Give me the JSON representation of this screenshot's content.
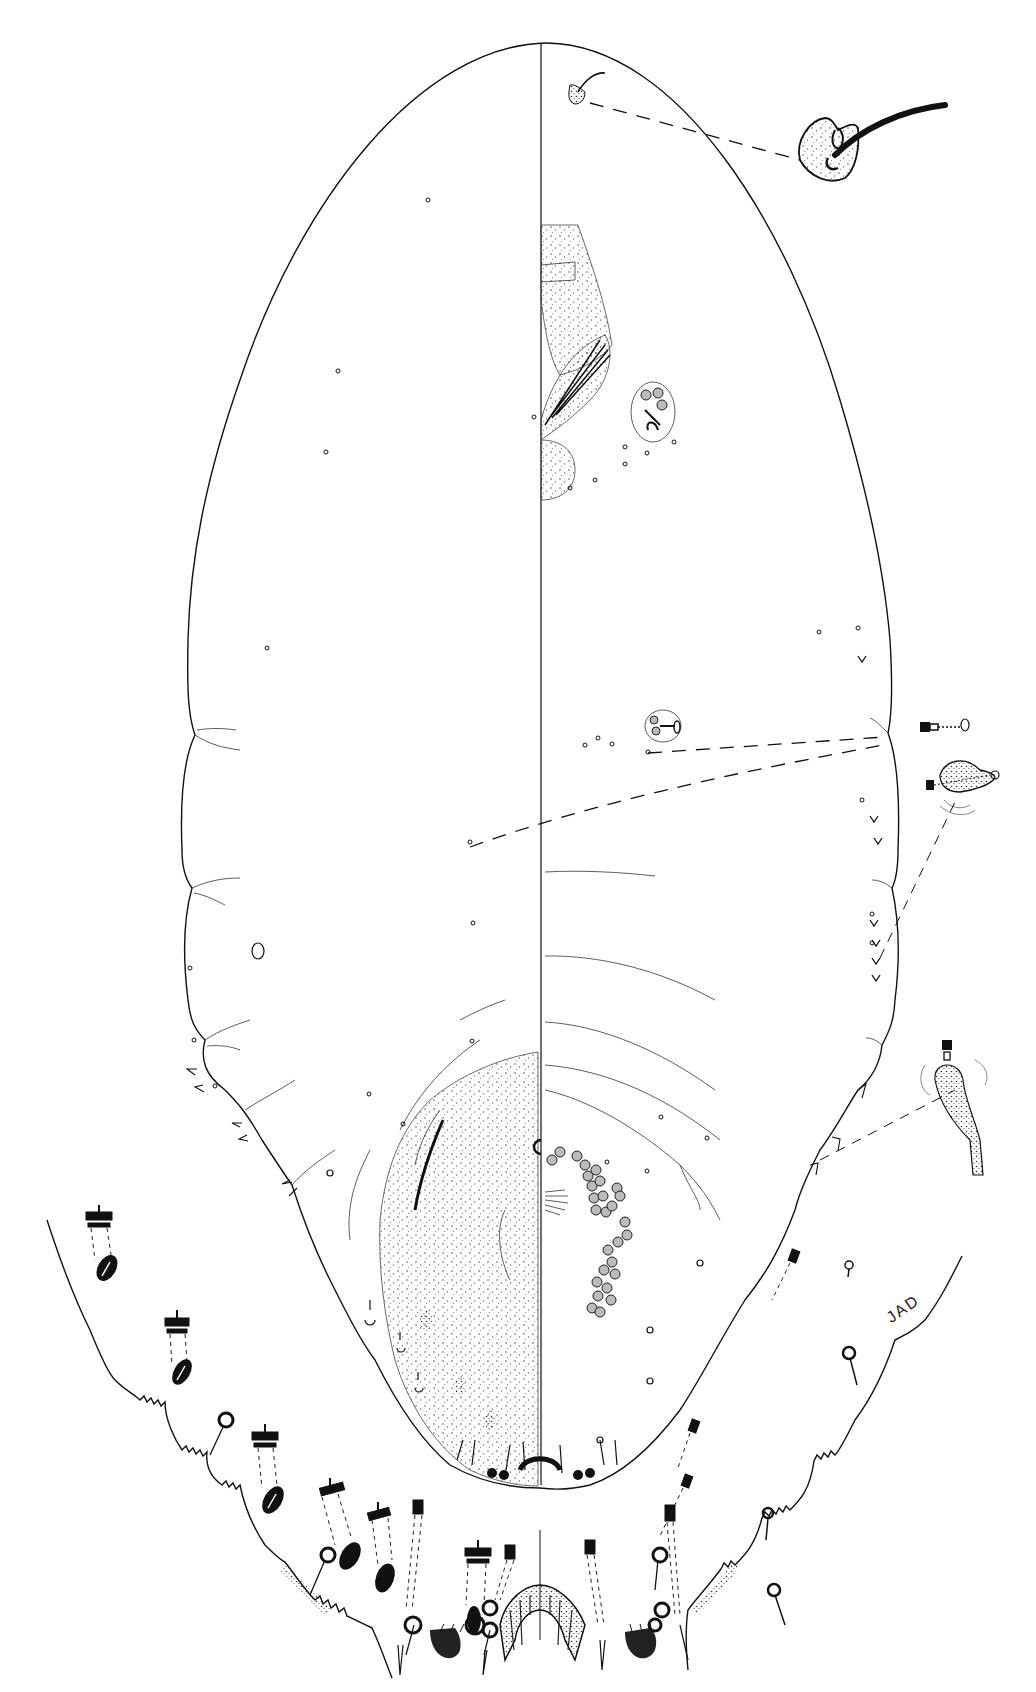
{
  "figure": {
    "type": "scientific-illustration",
    "signature": "JAD",
    "views": [
      "dorsum",
      "venter"
    ],
    "colors": {
      "ink": "#111111",
      "background": "#ffffff",
      "stipple": "#555555"
    }
  },
  "callouts": [
    {
      "name": "seta-enlarged",
      "description": "enlarged dorsal seta with sclerotized base"
    },
    {
      "name": "tubular-duct-enlarged",
      "description": "enlarged tubular duct"
    },
    {
      "name": "pore-cluster-enlarged",
      "description": "enlarged pore cluster"
    },
    {
      "name": "conical-seta-enlarged",
      "description": "enlarged conical cerarian seta"
    }
  ],
  "parts": {
    "midline": "body midline separating dorsal and ventral halves",
    "anal-lobes": "anal lobe region enlarged below",
    "multilocular-pores": "cluster of multilocular disc pores on venter"
  }
}
